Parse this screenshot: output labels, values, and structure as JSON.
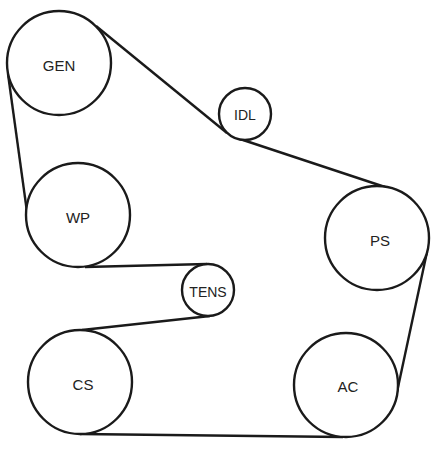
{
  "diagram": {
    "type": "serpentine-belt-routing",
    "colors": {
      "stroke": "#1a1a1a",
      "background": "#ffffff",
      "text": "#222222"
    },
    "pulleys": [
      {
        "id": "gen",
        "label": "GEN",
        "cx": 59,
        "cy": 63,
        "r": 52
      },
      {
        "id": "idl",
        "label": "IDL",
        "cx": 245,
        "cy": 114,
        "r": 26
      },
      {
        "id": "ps",
        "label": "PS",
        "cx": 377,
        "cy": 238,
        "r": 52
      },
      {
        "id": "ac",
        "label": "AC",
        "cx": 346,
        "cy": 385,
        "r": 52
      },
      {
        "id": "cs",
        "label": "CS",
        "cx": 80,
        "cy": 382,
        "r": 52
      },
      {
        "id": "tens",
        "label": "TENS",
        "cx": 208,
        "cy": 290,
        "r": 26
      },
      {
        "id": "wp",
        "label": "WP",
        "cx": 78,
        "cy": 215,
        "r": 52
      }
    ],
    "belt_route": [
      "GEN",
      "IDL",
      "PS",
      "AC",
      "CS",
      "TENS",
      "WP",
      "GEN"
    ]
  }
}
